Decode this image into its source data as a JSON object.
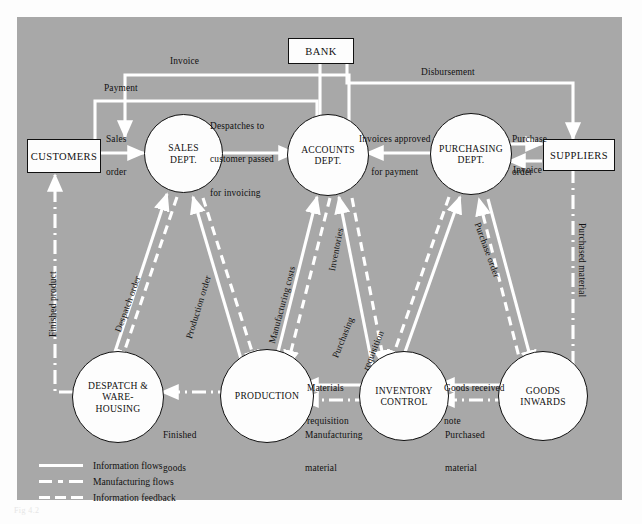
{
  "figure": {
    "caption": "Fig 4.2",
    "background_color": "#a8a8a8",
    "node_fill": "#fdfdfd",
    "flow_color": "#ffffff",
    "text_color": "#111111"
  },
  "nodes": {
    "customers": {
      "label": "CUSTOMERS",
      "shape": "box"
    },
    "bank": {
      "label": "BANK",
      "shape": "box"
    },
    "suppliers": {
      "label": "SUPPLIERS",
      "shape": "box"
    },
    "sales": {
      "label": "SALES\nDEPT.",
      "line1": "SALES",
      "line2": "DEPT.",
      "shape": "circle"
    },
    "accounts": {
      "label": "ACCOUNTS\nDEPT.",
      "line1": "ACCOUNTS",
      "line2": "DEPT.",
      "shape": "circle"
    },
    "purchasing": {
      "label": "PURCHASING\nDEPT.",
      "line1": "PURCHASING",
      "line2": "DEPT.",
      "shape": "circle"
    },
    "despatch": {
      "label": "DESPATCH &\nWARE-\nHOUSING",
      "line1": "DESPATCH &",
      "line2": "WARE-",
      "line3": "HOUSING",
      "shape": "circle"
    },
    "production": {
      "label": "PRODUCTION",
      "line1": "PRODUCTION",
      "shape": "circle"
    },
    "inventory": {
      "label": "INVENTORY\nCONTROL",
      "line1": "INVENTORY",
      "line2": "CONTROL",
      "shape": "circle"
    },
    "goods_inwards": {
      "label": "GOODS\nINWARDS",
      "line1": "GOODS",
      "line2": "INWARDS",
      "shape": "circle"
    }
  },
  "flow_labels": {
    "invoice_top": "Invoice",
    "payment": "Payment",
    "sales_order": "Sales\norder",
    "sales_order_l1": "Sales",
    "sales_order_l2": "order",
    "despatches": "Despatches to\ncustomer passed\nfor invoicing",
    "despatches_l1": "Despatches to",
    "despatches_l2": "customer passed",
    "despatches_l3": "for invoicing",
    "disbursement": "Disbursement",
    "invoices_approved": "Invoices approved\nfor payment",
    "invoices_approved_l1": "Invoices approved",
    "invoices_approved_l2": "for payment",
    "purchase_order_top": "Purchase\norder",
    "purchase_order_top_l1": "Purchase",
    "purchase_order_top_l2": "order",
    "invoice_suppliers": "Invoice",
    "finished_product": "Finished product",
    "despatch_order": "Despatch order",
    "production_order": "Production order",
    "manufacturing_costs": "Manufacturing costs",
    "inventories": "Inventories",
    "purchasing_requisition": "Purchasing\nrequisition",
    "purchasing_requisition_l1": "Purchasing",
    "purchasing_requisition_l2": "requisition",
    "purchase_order_diag": "Purchase order",
    "purchased_material_right": "Purchased material",
    "materials_requisition": "Materials\nrequisition",
    "materials_requisition_l1": "Materials",
    "materials_requisition_l2": "requisition",
    "goods_received_note": "Goods received\nnote",
    "goods_received_note_l1": "Goods received",
    "goods_received_note_l2": "note",
    "finished_goods": "Finished\ngoods",
    "finished_goods_l1": "Finished",
    "finished_goods_l2": "goods",
    "manufacturing_material": "Manufacturing\nmaterial",
    "manufacturing_material_l1": "Manufacturing",
    "manufacturing_material_l2": "material",
    "purchased_material_bottom": "Purchased\nmaterial",
    "purchased_material_bottom_l1": "Purchased",
    "purchased_material_bottom_l2": "material"
  },
  "legend": {
    "items": [
      {
        "label": "Information flows",
        "style": "solid"
      },
      {
        "label": "Manufacturing flows",
        "style": "dash-dot"
      },
      {
        "label": "Information feedback",
        "style": "dashed"
      }
    ]
  }
}
